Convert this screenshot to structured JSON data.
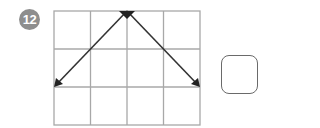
{
  "problem": {
    "number": "12",
    "badge_color": "#8e8e8e"
  },
  "grid": {
    "columns": 4,
    "rows": 3,
    "line_color": "#a8a8a8",
    "left": 54,
    "top": 11,
    "right": 200,
    "bottom": 125
  },
  "arrows": [
    {
      "from": [
        2,
        0
      ],
      "to": [
        0,
        2
      ],
      "description": "from top middle to left at row 2"
    },
    {
      "from": [
        2,
        0
      ],
      "to": [
        4,
        2
      ],
      "description": "from top middle to right at row 2"
    }
  ],
  "answer_box": {
    "value": ""
  },
  "colors": {
    "arrow": "#333333",
    "box_border": "#6a6a6a"
  }
}
